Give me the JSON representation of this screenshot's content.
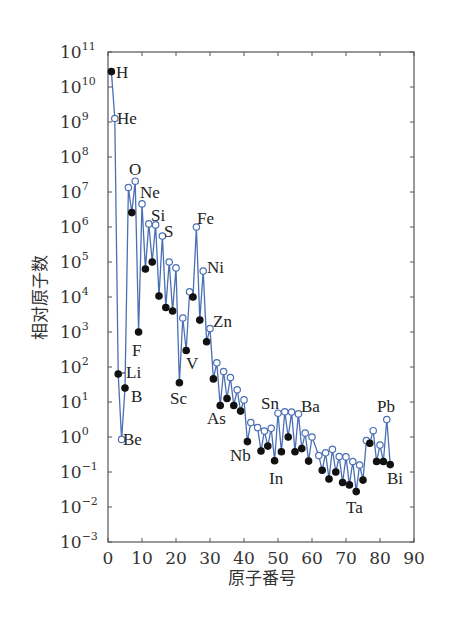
{
  "chart_data": {
    "type": "line",
    "title": "",
    "xlabel": "原子番号",
    "ylabel": "相对原子数",
    "xlim": [
      0,
      90
    ],
    "ylim_log10": [
      -3,
      11
    ],
    "x_ticks": [
      0,
      10,
      20,
      30,
      40,
      50,
      60,
      70,
      80,
      90
    ],
    "y_ticks_exponents": [
      11,
      10,
      9,
      8,
      7,
      6,
      5,
      4,
      3,
      2,
      1,
      0,
      -1,
      -2,
      -3
    ],
    "y_scale": "log",
    "grid": false,
    "legend": null,
    "line_color": "#4a6fb5",
    "marker_legend": {
      "filled": "odd atomic number (solid dot)",
      "open": "even atomic number (open circle)"
    },
    "series": [
      {
        "name": "relative abundance",
        "points": [
          {
            "z": 1,
            "el": "H",
            "log10": 10.44,
            "filled": true,
            "label": true
          },
          {
            "z": 2,
            "el": "He",
            "log10": 9.1,
            "filled": false,
            "label": true
          },
          {
            "z": 3,
            "el": "Li",
            "log10": 1.8,
            "filled": true,
            "label": true
          },
          {
            "z": 4,
            "el": "Be",
            "log10": -0.07,
            "filled": false,
            "label": true
          },
          {
            "z": 5,
            "el": "B",
            "log10": 1.4,
            "filled": true,
            "label": true
          },
          {
            "z": 6,
            "el": "C",
            "log10": 7.13,
            "filled": false,
            "label": false
          },
          {
            "z": 7,
            "el": "N",
            "log10": 6.41,
            "filled": true,
            "label": false
          },
          {
            "z": 8,
            "el": "O",
            "log10": 7.31,
            "filled": false,
            "label": true
          },
          {
            "z": 9,
            "el": "F",
            "log10": 3.0,
            "filled": true,
            "label": true
          },
          {
            "z": 10,
            "el": "Ne",
            "log10": 6.66,
            "filled": false,
            "label": true
          },
          {
            "z": 11,
            "el": "Na",
            "log10": 4.8,
            "filled": true,
            "label": false
          },
          {
            "z": 12,
            "el": "Mg",
            "log10": 6.09,
            "filled": false,
            "label": false
          },
          {
            "z": 13,
            "el": "Al",
            "log10": 5.0,
            "filled": true,
            "label": false
          },
          {
            "z": 14,
            "el": "Si",
            "log10": 6.06,
            "filled": false,
            "label": true
          },
          {
            "z": 15,
            "el": "P",
            "log10": 4.03,
            "filled": true,
            "label": false
          },
          {
            "z": 16,
            "el": "S",
            "log10": 5.74,
            "filled": false,
            "label": true
          },
          {
            "z": 17,
            "el": "Cl",
            "log10": 3.7,
            "filled": true,
            "label": false
          },
          {
            "z": 18,
            "el": "Ar",
            "log10": 5.0,
            "filled": false,
            "label": false
          },
          {
            "z": 19,
            "el": "K",
            "log10": 3.6,
            "filled": true,
            "label": false
          },
          {
            "z": 20,
            "el": "Ca",
            "log10": 4.83,
            "filled": false,
            "label": false
          },
          {
            "z": 21,
            "el": "Sc",
            "log10": 1.55,
            "filled": true,
            "label": true
          },
          {
            "z": 22,
            "el": "Ti",
            "log10": 3.4,
            "filled": false,
            "label": false
          },
          {
            "z": 23,
            "el": "V",
            "log10": 2.47,
            "filled": true,
            "label": true
          },
          {
            "z": 24,
            "el": "Cr",
            "log10": 4.15,
            "filled": false,
            "label": false
          },
          {
            "z": 25,
            "el": "Mn",
            "log10": 4.0,
            "filled": true,
            "label": false
          },
          {
            "z": 26,
            "el": "Fe",
            "log10": 6.0,
            "filled": false,
            "label": true
          },
          {
            "z": 27,
            "el": "Co",
            "log10": 3.34,
            "filled": true,
            "label": false
          },
          {
            "z": 28,
            "el": "Ni",
            "log10": 4.74,
            "filled": false,
            "label": true
          },
          {
            "z": 29,
            "el": "Cu",
            "log10": 2.72,
            "filled": true,
            "label": false
          },
          {
            "z": 30,
            "el": "Zn",
            "log10": 3.1,
            "filled": false,
            "label": true
          },
          {
            "z": 31,
            "el": "Ga",
            "log10": 1.66,
            "filled": true,
            "label": false
          },
          {
            "z": 32,
            "el": "Ge",
            "log10": 2.12,
            "filled": false,
            "label": false
          },
          {
            "z": 33,
            "el": "As",
            "log10": 0.9,
            "filled": true,
            "label": true
          },
          {
            "z": 34,
            "el": "Se",
            "log10": 1.87,
            "filled": false,
            "label": false
          },
          {
            "z": 35,
            "el": "Br",
            "log10": 1.1,
            "filled": true,
            "label": false
          },
          {
            "z": 36,
            "el": "Kr",
            "log10": 1.7,
            "filled": false,
            "label": false
          },
          {
            "z": 37,
            "el": "Rb",
            "log10": 0.9,
            "filled": true,
            "label": false
          },
          {
            "z": 38,
            "el": "Sr",
            "log10": 1.35,
            "filled": false,
            "label": false
          },
          {
            "z": 39,
            "el": "Y",
            "log10": 0.74,
            "filled": true,
            "label": false
          },
          {
            "z": 40,
            "el": "Zr",
            "log10": 1.06,
            "filled": false,
            "label": false
          },
          {
            "z": 41,
            "el": "Nb",
            "log10": -0.13,
            "filled": true,
            "label": true
          },
          {
            "z": 42,
            "el": "Mo",
            "log10": 0.41,
            "filled": false,
            "label": false
          },
          {
            "z": 44,
            "el": "Ru",
            "log10": 0.27,
            "filled": false,
            "label": false
          },
          {
            "z": 45,
            "el": "Rh",
            "log10": -0.4,
            "filled": true,
            "label": false
          },
          {
            "z": 46,
            "el": "Pd",
            "log10": 0.17,
            "filled": false,
            "label": false
          },
          {
            "z": 47,
            "el": "Ag",
            "log10": -0.26,
            "filled": true,
            "label": false
          },
          {
            "z": 48,
            "el": "Cd",
            "log10": 0.25,
            "filled": false,
            "label": false
          },
          {
            "z": 49,
            "el": "In",
            "log10": -0.68,
            "filled": true,
            "label": true
          },
          {
            "z": 50,
            "el": "Sn",
            "log10": 0.68,
            "filled": false,
            "label": true
          },
          {
            "z": 51,
            "el": "Sb",
            "log10": -0.42,
            "filled": true,
            "label": false
          },
          {
            "z": 52,
            "el": "Te",
            "log10": 0.72,
            "filled": false,
            "label": false
          },
          {
            "z": 53,
            "el": "I",
            "log10": 0.0,
            "filled": true,
            "label": false
          },
          {
            "z": 54,
            "el": "Xe",
            "log10": 0.71,
            "filled": false,
            "label": false
          },
          {
            "z": 55,
            "el": "Cs",
            "log10": -0.42,
            "filled": true,
            "label": false
          },
          {
            "z": 56,
            "el": "Ba",
            "log10": 0.66,
            "filled": false,
            "label": true
          },
          {
            "z": 57,
            "el": "La",
            "log10": -0.33,
            "filled": true,
            "label": false
          },
          {
            "z": 58,
            "el": "Ce",
            "log10": 0.11,
            "filled": false,
            "label": false
          },
          {
            "z": 59,
            "el": "Pr",
            "log10": -0.69,
            "filled": true,
            "label": false
          },
          {
            "z": 60,
            "el": "Nd",
            "log10": 0.0,
            "filled": false,
            "label": false
          },
          {
            "z": 62,
            "el": "Sm",
            "log10": -0.53,
            "filled": false,
            "label": false
          },
          {
            "z": 63,
            "el": "Eu",
            "log10": -0.95,
            "filled": true,
            "label": false
          },
          {
            "z": 64,
            "el": "Gd",
            "log10": -0.45,
            "filled": false,
            "label": false
          },
          {
            "z": 65,
            "el": "Tb",
            "log10": -1.2,
            "filled": true,
            "label": false
          },
          {
            "z": 66,
            "el": "Dy",
            "log10": -0.35,
            "filled": false,
            "label": false
          },
          {
            "z": 67,
            "el": "Ho",
            "log10": -1.0,
            "filled": true,
            "label": false
          },
          {
            "z": 68,
            "el": "Er",
            "log10": -0.56,
            "filled": false,
            "label": false
          },
          {
            "z": 69,
            "el": "Tm",
            "log10": -1.3,
            "filled": true,
            "label": false
          },
          {
            "z": 70,
            "el": "Yb",
            "log10": -0.57,
            "filled": false,
            "label": false
          },
          {
            "z": 71,
            "el": "Lu",
            "log10": -1.37,
            "filled": true,
            "label": false
          },
          {
            "z": 72,
            "el": "Hf",
            "log10": -0.7,
            "filled": false,
            "label": false
          },
          {
            "z": 73,
            "el": "Ta",
            "log10": -1.56,
            "filled": true,
            "label": true
          },
          {
            "z": 74,
            "el": "W",
            "log10": -0.8,
            "filled": false,
            "label": false
          },
          {
            "z": 75,
            "el": "Re",
            "log10": -1.23,
            "filled": true,
            "label": false
          },
          {
            "z": 76,
            "el": "Os",
            "log10": -0.1,
            "filled": false,
            "label": false
          },
          {
            "z": 77,
            "el": "Ir",
            "log10": -0.18,
            "filled": true,
            "label": false
          },
          {
            "z": 78,
            "el": "Pt",
            "log10": 0.18,
            "filled": false,
            "label": false
          },
          {
            "z": 79,
            "el": "Au",
            "log10": -0.7,
            "filled": true,
            "label": false
          },
          {
            "z": 80,
            "el": "Hg",
            "log10": -0.23,
            "filled": false,
            "label": false
          },
          {
            "z": 81,
            "el": "Tl",
            "log10": -0.7,
            "filled": true,
            "label": false
          },
          {
            "z": 82,
            "el": "Pb",
            "log10": 0.5,
            "filled": false,
            "label": true
          },
          {
            "z": 83,
            "el": "Bi",
            "log10": -0.79,
            "filled": true,
            "label": true
          }
        ]
      }
    ],
    "annotations": [
      {
        "text": "H",
        "x": 116,
        "y": 78
      },
      {
        "text": "He",
        "x": 117,
        "y": 124
      },
      {
        "text": "O",
        "x": 129,
        "y": 175
      },
      {
        "text": "Ne",
        "x": 140,
        "y": 198
      },
      {
        "text": "Si",
        "x": 151,
        "y": 221
      },
      {
        "text": "S",
        "x": 164,
        "y": 237
      },
      {
        "text": "Fe",
        "x": 197,
        "y": 224
      },
      {
        "text": "Ni",
        "x": 207,
        "y": 273
      },
      {
        "text": "Zn",
        "x": 213,
        "y": 327
      },
      {
        "text": "F",
        "x": 132,
        "y": 356
      },
      {
        "text": "Li",
        "x": 126,
        "y": 378
      },
      {
        "text": "B",
        "x": 131,
        "y": 402
      },
      {
        "text": "Be",
        "x": 123,
        "y": 445
      },
      {
        "text": "Sc",
        "x": 170,
        "y": 404
      },
      {
        "text": "V",
        "x": 186,
        "y": 369
      },
      {
        "text": "As",
        "x": 207,
        "y": 424
      },
      {
        "text": "Nb",
        "x": 230,
        "y": 461
      },
      {
        "text": "In",
        "x": 269,
        "y": 484
      },
      {
        "text": "Sn",
        "x": 261,
        "y": 409
      },
      {
        "text": "Ba",
        "x": 301,
        "y": 412
      },
      {
        "text": "Ta",
        "x": 346,
        "y": 513
      },
      {
        "text": "Pb",
        "x": 377,
        "y": 412
      },
      {
        "text": "Bi",
        "x": 387,
        "y": 484
      }
    ]
  }
}
